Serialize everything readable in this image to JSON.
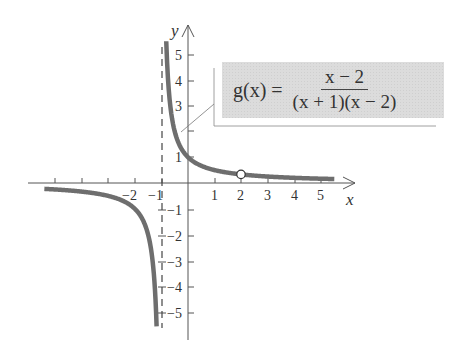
{
  "chart_data": {
    "type": "line",
    "title": "",
    "function_label": {
      "lhs": "g(x) =",
      "numerator": "x − 2",
      "denominator": "(x + 1)(x − 2)"
    },
    "simplified": "g(x) = 1/(x + 1), x ≠ 2",
    "xlabel": "x",
    "ylabel": "y",
    "xlim": [
      -5.7,
      6.2
    ],
    "ylim": [
      -6.0,
      6.0
    ],
    "x_ticks": [
      -5,
      -4,
      -3,
      -2,
      -1,
      1,
      2,
      3,
      4,
      5
    ],
    "x_tick_labels": [
      "−2",
      "−1",
      "1",
      "2",
      "3",
      "4",
      "5"
    ],
    "y_ticks": [
      -5,
      -4,
      -3,
      -2,
      -1,
      1,
      2,
      3,
      4,
      5
    ],
    "y_tick_labels": [
      "5",
      "4",
      "3",
      "1",
      "−1",
      "−2",
      "−3",
      "−4",
      "−5"
    ],
    "vertical_asymptote": {
      "x": -1,
      "style": "dashed"
    },
    "horizontal_asymptote": {
      "y": 0
    },
    "hole": {
      "x": 2,
      "y": 0.3333,
      "style": "open circle"
    },
    "series": [
      {
        "name": "left branch",
        "x": [
          -5.4,
          -5,
          -4,
          -3,
          -2.5,
          -2,
          -1.6,
          -1.4,
          -1.3,
          -1.25,
          -1.2,
          -1.18
        ],
        "y": [
          -0.227,
          -0.25,
          -0.333,
          -0.5,
          -0.667,
          -1,
          -1.667,
          -2.5,
          -3.333,
          -4,
          -5,
          -5.56
        ]
      },
      {
        "name": "right branch",
        "x": [
          -0.818,
          -0.8,
          -0.75,
          -0.7,
          -0.6,
          -0.5,
          -0.3,
          0,
          0.5,
          1,
          2,
          3,
          4,
          5,
          5.5
        ],
        "y": [
          5.5,
          5,
          4,
          3.333,
          2.5,
          2,
          1.429,
          1,
          0.667,
          0.5,
          0.333,
          0.25,
          0.2,
          0.167,
          0.154
        ]
      }
    ],
    "grid": false,
    "legend": "none",
    "colors": {
      "curve": "#6e6e6e",
      "axis": "#555555",
      "label_box": "#dcdcdc"
    }
  }
}
